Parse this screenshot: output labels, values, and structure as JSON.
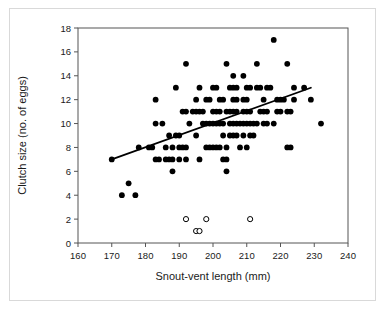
{
  "chart_data": {
    "type": "scatter",
    "title": "",
    "xlabel": "Snout-vent length (mm)",
    "ylabel": "Clutch size (no. of eggs)",
    "xlim": [
      160,
      240
    ],
    "ylim": [
      0,
      18
    ],
    "xticks": [
      160,
      170,
      180,
      190,
      200,
      210,
      220,
      230,
      240
    ],
    "yticks": [
      0,
      2,
      4,
      6,
      8,
      10,
      12,
      14,
      16,
      18
    ],
    "grid": false,
    "legend": "none",
    "marker_colors": {
      "filled": "#000000",
      "open_fill": "#ffffff",
      "open_stroke": "#000000",
      "regression_line": "#000000"
    },
    "series": [
      {
        "name": "Clutches with eggs (filled circles)",
        "marker": "filled-circle",
        "points": [
          [
            173,
            4
          ],
          [
            177,
            4
          ],
          [
            175,
            5
          ],
          [
            170,
            7
          ],
          [
            181,
            8
          ],
          [
            182,
            8
          ],
          [
            178,
            8
          ],
          [
            183,
            7
          ],
          [
            184,
            7
          ],
          [
            186,
            7
          ],
          [
            187,
            7
          ],
          [
            188,
            7
          ],
          [
            190,
            7
          ],
          [
            192,
            7
          ],
          [
            183,
            10
          ],
          [
            185,
            10
          ],
          [
            183,
            12
          ],
          [
            187,
            9
          ],
          [
            188,
            6
          ],
          [
            186,
            8
          ],
          [
            188,
            8
          ],
          [
            190,
            8
          ],
          [
            191,
            8
          ],
          [
            192,
            8
          ],
          [
            189,
            9
          ],
          [
            190,
            9
          ],
          [
            189,
            13
          ],
          [
            191,
            11
          ],
          [
            192,
            11
          ],
          [
            193,
            10
          ],
          [
            195,
            9
          ],
          [
            196,
            7
          ],
          [
            194,
            11
          ],
          [
            195,
            11
          ],
          [
            196,
            11
          ],
          [
            197,
            11
          ],
          [
            195,
            12
          ],
          [
            196,
            13
          ],
          [
            197,
            10
          ],
          [
            198,
            10
          ],
          [
            199,
            10
          ],
          [
            198,
            8
          ],
          [
            199,
            8
          ],
          [
            198,
            12
          ],
          [
            199,
            12
          ],
          [
            200,
            11
          ],
          [
            201,
            11
          ],
          [
            202,
            11
          ],
          [
            200,
            10
          ],
          [
            201,
            10
          ],
          [
            202,
            10
          ],
          [
            203,
            10
          ],
          [
            200,
            8
          ],
          [
            201,
            8
          ],
          [
            202,
            8
          ],
          [
            200,
            13
          ],
          [
            201,
            13
          ],
          [
            202,
            12
          ],
          [
            203,
            12
          ],
          [
            203,
            7
          ],
          [
            204,
            7
          ],
          [
            204,
            6
          ],
          [
            204,
            8
          ],
          [
            203,
            9
          ],
          [
            205,
            9
          ],
          [
            206,
            9
          ],
          [
            207,
            9
          ],
          [
            204,
            11
          ],
          [
            205,
            11
          ],
          [
            206,
            11
          ],
          [
            207,
            11
          ],
          [
            205,
            10
          ],
          [
            206,
            10
          ],
          [
            207,
            10
          ],
          [
            208,
            10
          ],
          [
            205,
            13
          ],
          [
            206,
            13
          ],
          [
            207,
            13
          ],
          [
            206,
            12
          ],
          [
            207,
            12
          ],
          [
            206,
            14
          ],
          [
            209,
            14
          ],
          [
            204,
            15
          ],
          [
            192,
            15
          ],
          [
            209,
            12
          ],
          [
            210,
            12
          ],
          [
            209,
            11
          ],
          [
            210,
            11
          ],
          [
            211,
            11
          ],
          [
            209,
            10
          ],
          [
            210,
            10
          ],
          [
            211,
            10
          ],
          [
            212,
            10
          ],
          [
            213,
            10
          ],
          [
            209,
            9
          ],
          [
            211,
            9
          ],
          [
            212,
            9
          ],
          [
            208,
            8
          ],
          [
            210,
            8
          ],
          [
            210,
            13
          ],
          [
            211,
            13
          ],
          [
            213,
            13
          ],
          [
            214,
            13
          ],
          [
            213,
            15
          ],
          [
            218,
            17
          ],
          [
            222,
            15
          ],
          [
            214,
            11
          ],
          [
            215,
            11
          ],
          [
            216,
            11
          ],
          [
            219,
            11
          ],
          [
            220,
            11
          ],
          [
            215,
            12
          ],
          [
            219,
            12
          ],
          [
            220,
            12
          ],
          [
            215,
            10
          ],
          [
            216,
            10
          ],
          [
            218,
            10
          ],
          [
            216,
            13
          ],
          [
            217,
            13
          ],
          [
            221,
            12
          ],
          [
            222,
            11
          ],
          [
            223,
            11
          ],
          [
            222,
            8
          ],
          [
            223,
            8
          ],
          [
            224,
            12
          ],
          [
            224,
            13
          ],
          [
            227,
            13
          ],
          [
            229,
            12
          ],
          [
            232,
            10
          ]
        ]
      },
      {
        "name": "Clutches without eggs (open circles)",
        "marker": "open-circle",
        "points": [
          [
            192,
            2
          ],
          [
            198,
            2
          ],
          [
            211,
            2
          ],
          [
            195,
            1
          ],
          [
            196,
            1
          ]
        ]
      }
    ],
    "regression_line": {
      "x_start": 170,
      "y_start": 7.0,
      "x_end": 229,
      "y_end": 13.0,
      "style": "solid",
      "width": 1.8
    }
  },
  "figure": {
    "background": "#ffffff",
    "border_color": "#d9d9d9"
  }
}
